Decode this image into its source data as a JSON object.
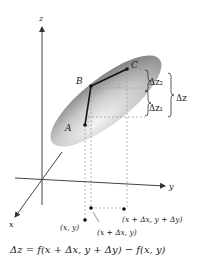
{
  "diagram": {
    "axes": {
      "z": "z",
      "y": "y",
      "x": "x"
    },
    "points": {
      "A": "A",
      "B": "B",
      "C": "C"
    },
    "increments": {
      "dz2": "Δz₂",
      "dz1": "Δz₁",
      "dz": "Δz"
    },
    "base_points": {
      "p1": "(x, y)",
      "p2": "(x + Δx, y)",
      "p3": "(x + Δx, y + Δy)"
    },
    "formula": "Δz = f(x + Δx, y + Δy) − f(x, y)",
    "colors": {
      "surface_dark": "#8a8a8a",
      "surface_light": "#e8e8e8",
      "line": "#111111",
      "dashed": "#999999"
    }
  }
}
